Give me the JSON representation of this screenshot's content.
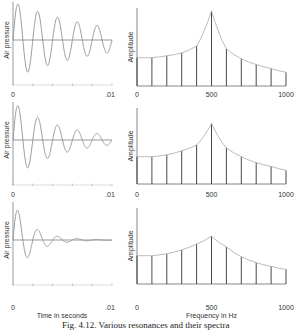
{
  "caption": "Fig. 4.12. Various resonances and their spectra",
  "colors": {
    "wave": "#9a9a9a",
    "axis": "#555555",
    "bar": "#333333",
    "envelope": "#aaaaaa"
  },
  "chart_data": [
    {
      "type": "line",
      "title": "Waveform, light damping",
      "ylabel": "Air pressure",
      "xlabel": "",
      "x_ticks": [
        "0",
        ".01"
      ],
      "xlim": [
        0,
        0.01
      ],
      "frequency_hz": 500,
      "damping": "low",
      "row": 0
    },
    {
      "type": "bar",
      "title": "Spectrum, light damping",
      "ylabel": "Amplitude",
      "xlabel": "",
      "x_ticks": [
        "0",
        "500",
        "1000"
      ],
      "categories": [
        0,
        100,
        200,
        300,
        400,
        500,
        600,
        700,
        800,
        900,
        1000
      ],
      "values": [
        29,
        29,
        31,
        34,
        41,
        77,
        38,
        28,
        22,
        18,
        14
      ],
      "ylim": [
        0,
        80
      ],
      "row": 0
    },
    {
      "type": "line",
      "title": "Waveform, medium damping",
      "ylabel": "Air pressure",
      "xlabel": "",
      "x_ticks": [
        "0",
        ".01"
      ],
      "xlim": [
        0,
        0.01
      ],
      "frequency_hz": 500,
      "damping": "medium",
      "row": 1
    },
    {
      "type": "bar",
      "title": "Spectrum, medium damping",
      "ylabel": "Amplitude",
      "xlabel": "",
      "x_ticks": [
        "0",
        "500",
        "1000"
      ],
      "categories": [
        0,
        100,
        200,
        300,
        400,
        500,
        600,
        700,
        800,
        900,
        1000
      ],
      "values": [
        28,
        28,
        30,
        34,
        40,
        62,
        37,
        28,
        22,
        18,
        14
      ],
      "ylim": [
        0,
        80
      ],
      "row": 1
    },
    {
      "type": "line",
      "title": "Waveform, heavy damping",
      "ylabel": "Air pressure",
      "xlabel": "Time in seconds",
      "x_ticks": [
        "0",
        ".01"
      ],
      "xlim": [
        0,
        0.01
      ],
      "frequency_hz": 500,
      "damping": "high",
      "row": 2
    },
    {
      "type": "bar",
      "title": "Spectrum, heavy damping",
      "ylabel": "Amplitude",
      "xlabel": "Frequency in Hz",
      "x_ticks": [
        "0",
        "500",
        "1000"
      ],
      "categories": [
        0,
        100,
        200,
        300,
        400,
        500,
        600,
        700,
        800,
        900,
        1000
      ],
      "values": [
        29,
        29,
        31,
        35,
        41,
        49,
        38,
        28,
        22,
        18,
        15
      ],
      "ylim": [
        0,
        80
      ],
      "row": 2
    }
  ]
}
